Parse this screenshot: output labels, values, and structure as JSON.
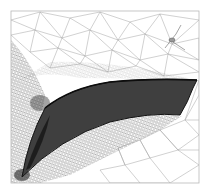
{
  "figure": {
    "colors": {
      "background": "#ffffff",
      "frame": "#b8b8b8",
      "coarse_mesh": "#9a9a9a",
      "fine_mesh": "#6f6f6f",
      "blade_fill": "#2a2a2a",
      "blade_dark": "#111111"
    },
    "frame": {
      "x": 11,
      "y": 11,
      "w": 188,
      "h": 172
    },
    "blade": {
      "leading_edge": [
        22,
        176
      ],
      "trailing_edge_top": [
        197,
        80
      ],
      "trailing_edge_bottom": [
        180,
        115
      ]
    },
    "probe_marker": {
      "x": 173,
      "y": 39
    }
  }
}
